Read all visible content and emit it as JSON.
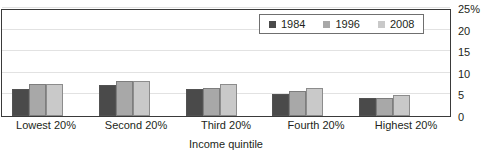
{
  "chart_data": {
    "type": "bar",
    "title": "",
    "xlabel": "Income quintile",
    "ylabel": "",
    "categories": [
      "Lowest 20%",
      "Second 20%",
      "Third 20%",
      "Fourth 20%",
      "Highest 20%"
    ],
    "series": [
      {
        "name": "1984",
        "color": "#4a4a4a",
        "values": [
          6.3,
          7.2,
          6.3,
          5.0,
          4.1
        ]
      },
      {
        "name": "1996",
        "color": "#a8a8a8",
        "values": [
          7.3,
          8.0,
          6.4,
          5.7,
          4.2
        ]
      },
      {
        "name": "2008",
        "color": "#c9c9c9",
        "values": [
          7.5,
          8.0,
          7.3,
          6.6,
          4.9
        ]
      }
    ],
    "ylim": [
      0,
      25
    ],
    "yticks": [
      {
        "value": 25,
        "label": "25%"
      },
      {
        "value": 20,
        "label": "20"
      },
      {
        "value": 15,
        "label": "15"
      },
      {
        "value": 10,
        "label": "10"
      },
      {
        "value": 5,
        "label": "5"
      },
      {
        "value": 0,
        "label": "0"
      }
    ],
    "grid": true,
    "legend_position": "top-right"
  },
  "legend": {
    "items": [
      {
        "label": "1984",
        "color": "#4a4a4a"
      },
      {
        "label": "1996",
        "color": "#a8a8a8"
      },
      {
        "label": "2008",
        "color": "#c9c9c9"
      }
    ]
  },
  "axis": {
    "x_title": "Income quintile"
  }
}
